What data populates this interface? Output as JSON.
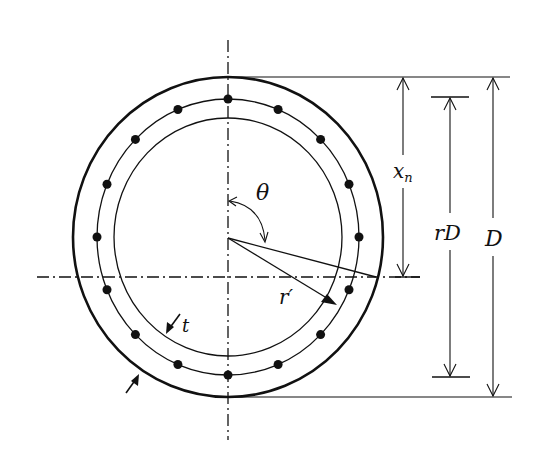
{
  "diagram": {
    "colors": {
      "stroke": "#111111",
      "background": "#ffffff"
    },
    "section": {
      "center": [
        228,
        237
      ],
      "outer_rx": 155,
      "outer_ry": 160,
      "bar_ring_rx": 131,
      "bar_ring_ry": 138,
      "inner_rx": 114,
      "inner_ry": 119,
      "bar_count": 16,
      "bar_radius": 4.5
    },
    "labels": {
      "theta": "θ",
      "r_prime": "r′",
      "t": "t",
      "xn": "x",
      "xn_sub": "n",
      "rD": "rD",
      "D": "D"
    }
  }
}
